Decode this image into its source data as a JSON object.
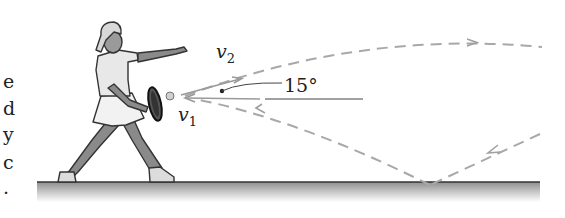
{
  "figure": {
    "labels": {
      "v2_main": "v",
      "v2_sub": "2",
      "v1_main": "v",
      "v1_sub": "1",
      "angle": "15°"
    },
    "left_text_fragments": [
      "e",
      "d",
      "y",
      "c",
      "."
    ],
    "colors": {
      "path_dash": "#a8a8a8",
      "ink": "#222222",
      "ground_line": "#333333",
      "ground_shade_top": "#9a9a9a",
      "ground_shade_bottom": "#ffffff"
    }
  }
}
